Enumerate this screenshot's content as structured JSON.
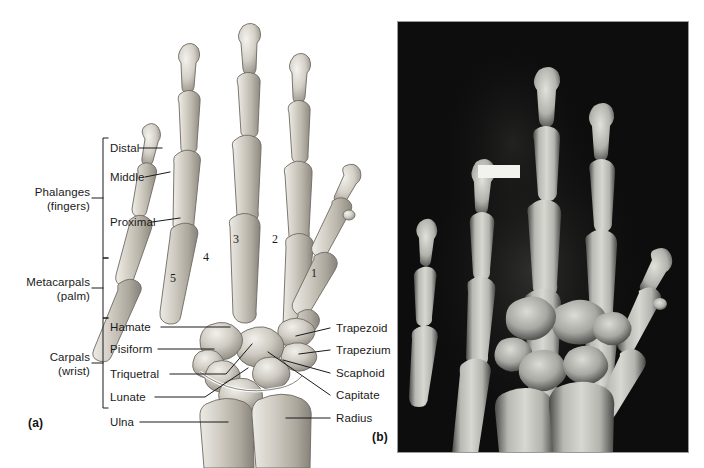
{
  "figure": {
    "panels": [
      {
        "id": "a",
        "letter": "(a)",
        "type": "illustration"
      },
      {
        "id": "b",
        "letter": "(b)",
        "type": "radiograph"
      }
    ]
  },
  "groups": [
    {
      "name": "phalanges",
      "line1": "Phalanges",
      "line2": "(fingers)"
    },
    {
      "name": "metacarpals",
      "line1": "Metacarpals",
      "line2": "(palm)"
    },
    {
      "name": "carpals",
      "line1": "Carpals",
      "line2": "(wrist)"
    }
  ],
  "phalanx_labels": [
    {
      "name": "distal",
      "label": "Distal"
    },
    {
      "name": "middle",
      "label": "Middle"
    },
    {
      "name": "proximal",
      "label": "Proximal"
    }
  ],
  "metacarpal_numbers": [
    "1",
    "2",
    "3",
    "4",
    "5"
  ],
  "left_labels": [
    {
      "name": "hamate",
      "label": "Hamate"
    },
    {
      "name": "pisiform",
      "label": "Pisiform"
    },
    {
      "name": "triquetral",
      "label": "Triquetral"
    },
    {
      "name": "lunate",
      "label": "Lunate"
    },
    {
      "name": "ulna",
      "label": "Ulna"
    }
  ],
  "right_labels": [
    {
      "name": "trapezoid",
      "label": "Trapezoid"
    },
    {
      "name": "trapezium",
      "label": "Trapezium"
    },
    {
      "name": "scaphoid",
      "label": "Scaphoid"
    },
    {
      "name": "capitate",
      "label": "Capitate"
    },
    {
      "name": "radius",
      "label": "Radius"
    }
  ],
  "colors": {
    "bone_light": "#e3e0da",
    "bone_mid": "#c6c2b8",
    "bone_shadow": "#9b968b",
    "outline": "#6d6a62",
    "leader": "#1a1a1a",
    "xray_bg": "#0d0d0d",
    "xray_bone": "#cfcfcb",
    "marker": "#f2f2ee",
    "text": "#1a1a1a"
  }
}
